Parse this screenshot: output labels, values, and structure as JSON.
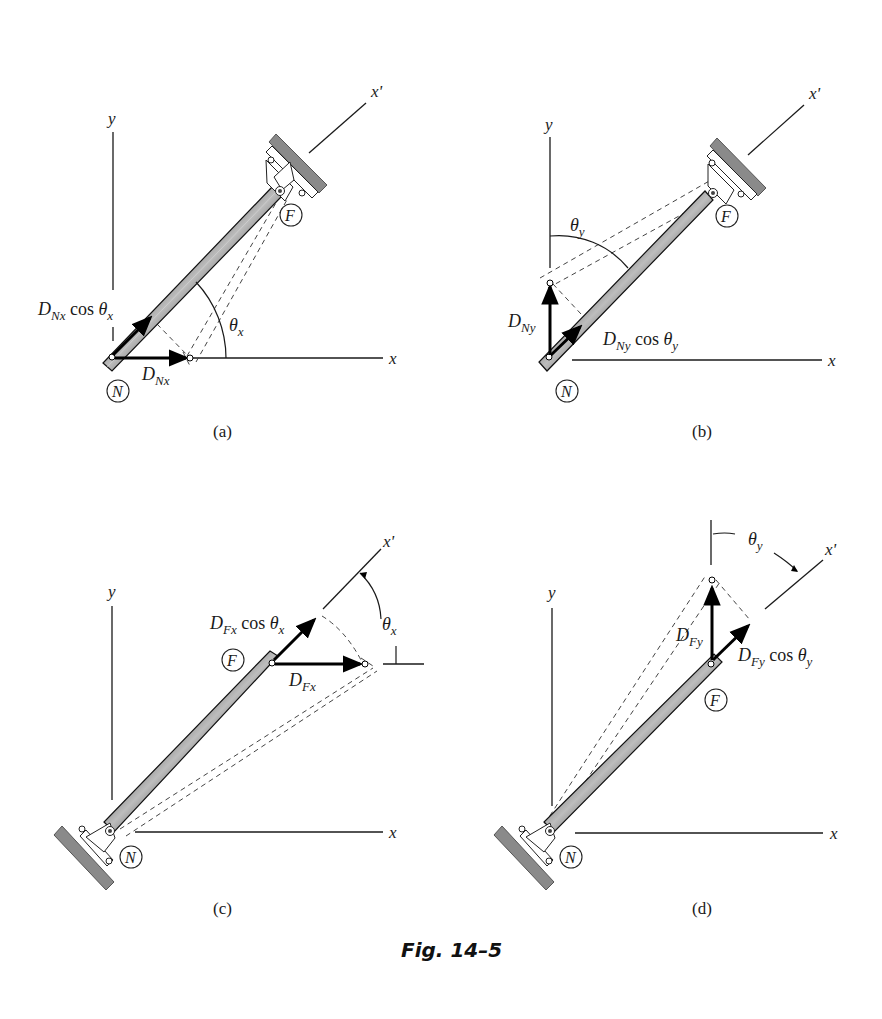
{
  "figure": {
    "caption": "Fig. 14–5",
    "panels": [
      {
        "id": "a",
        "label": "(a)",
        "axes": {
          "x": "x",
          "y": "y",
          "xprime": "x'"
        },
        "nodes": {
          "start": "N",
          "end": "F"
        },
        "support_at": "F",
        "vectors": [
          {
            "name": "D_Nx",
            "label_main": "D",
            "label_sub": "Nx",
            "direction": "horizontal (+x)"
          },
          {
            "name": "D_Nx cos θx",
            "label_main": "D",
            "label_sub": "Nx",
            "suffix": " cos θ",
            "suffix_sub": "x",
            "direction": "along x'"
          }
        ],
        "angle": {
          "symbol": "θ",
          "sub": "x",
          "between": "x and x'"
        }
      },
      {
        "id": "b",
        "label": "(b)",
        "axes": {
          "x": "x",
          "y": "y",
          "xprime": "x'"
        },
        "nodes": {
          "start": "N",
          "end": "F"
        },
        "support_at": "F",
        "vectors": [
          {
            "name": "D_Ny",
            "label_main": "D",
            "label_sub": "Ny",
            "direction": "vertical (+y)"
          },
          {
            "name": "D_Ny cos θy",
            "label_main": "D",
            "label_sub": "Ny",
            "suffix": " cos θ",
            "suffix_sub": "y",
            "direction": "along x'"
          }
        ],
        "angle": {
          "symbol": "θ",
          "sub": "y",
          "between": "y and x'"
        }
      },
      {
        "id": "c",
        "label": "(c)",
        "axes": {
          "x": "x",
          "y": "y",
          "xprime": "x'"
        },
        "nodes": {
          "start": "N",
          "end": "F"
        },
        "support_at": "N",
        "vectors": [
          {
            "name": "D_Fx",
            "label_main": "D",
            "label_sub": "Fx",
            "direction": "horizontal (+x)"
          },
          {
            "name": "D_Fx cos θx",
            "label_main": "D",
            "label_sub": "Fx",
            "suffix": " cos θ",
            "suffix_sub": "x",
            "direction": "along x'"
          }
        ],
        "angle": {
          "symbol": "θ",
          "sub": "x",
          "between": "x and x'"
        }
      },
      {
        "id": "d",
        "label": "(d)",
        "axes": {
          "x": "x",
          "y": "y",
          "xprime": "x'"
        },
        "nodes": {
          "start": "N",
          "end": "F"
        },
        "support_at": "N",
        "vectors": [
          {
            "name": "D_Fy",
            "label_main": "D",
            "label_sub": "Fy",
            "direction": "vertical (+y)"
          },
          {
            "name": "D_Fy cos θy",
            "label_main": "D",
            "label_sub": "Fy",
            "suffix": " cos θ",
            "suffix_sub": "y",
            "direction": "along x'"
          }
        ],
        "angle": {
          "symbol": "θ",
          "sub": "y",
          "between": "y and x'"
        }
      }
    ]
  },
  "text": {
    "x": "x",
    "y": "y",
    "xprime": "x'",
    "N": "N",
    "F": "F",
    "D": "D",
    "cos": "cos",
    "theta": "θ",
    "sub_Nx": "Nx",
    "sub_Ny": "Ny",
    "sub_Fx": "Fx",
    "sub_Fy": "Fy",
    "sub_x": "x",
    "sub_y": "y",
    "label_a": "(a)",
    "label_b": "(b)",
    "label_c": "(c)",
    "label_d": "(d)",
    "caption": "Fig. 14–5"
  }
}
